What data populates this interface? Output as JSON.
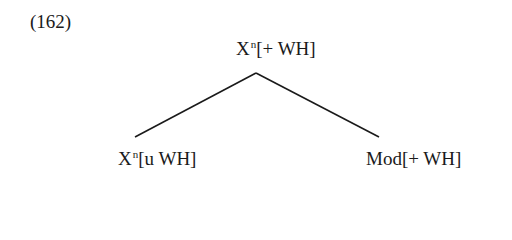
{
  "example": {
    "number": "(162)"
  },
  "tree": {
    "root": {
      "category": "X",
      "superscript": "n",
      "features": "[+ WH]"
    },
    "children": [
      {
        "category": "X",
        "superscript": "n",
        "features": "[u WH]"
      },
      {
        "category": "Mod",
        "superscript": "",
        "features": "[+ WH]"
      }
    ]
  },
  "style": {
    "line_color": "#1a1a1a",
    "text_color": "#1a1a1a",
    "background": "#ffffff"
  }
}
